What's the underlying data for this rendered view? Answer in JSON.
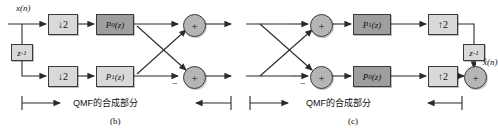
{
  "figure": {
    "name": "qmf-polyphase-analysis-synthesis",
    "panels": [
      {
        "id": "b",
        "panel_label": "(b)",
        "caption": "QMF的合成部分",
        "input_label": "x(n)",
        "output_label": "",
        "blocks": {
          "delay": {
            "label": "z",
            "exponent": "-1"
          },
          "sampler_top": {
            "label": "↓2"
          },
          "sampler_bottom": {
            "label": "↓2"
          },
          "filter_top": {
            "name": "P",
            "subscript": "0",
            "arg": "(z)",
            "shade": "dark"
          },
          "filter_bottom": {
            "name": "P",
            "subscript": "1",
            "arg": "(z)",
            "shade": "light"
          }
        },
        "adders": {
          "top": {
            "symbol": "+",
            "minus_port": "none"
          },
          "bottom": {
            "symbol": "+",
            "minus_port": "left"
          }
        },
        "minus_sign": "−"
      },
      {
        "id": "c",
        "panel_label": "(c)",
        "caption": "QMF的合成部分",
        "input_label": "",
        "output_label": "x̂(n)",
        "blocks": {
          "delay": {
            "label": "z",
            "exponent": "-1"
          },
          "sampler_top": {
            "label": "↑2"
          },
          "sampler_bottom": {
            "label": "↑2"
          },
          "filter_top": {
            "name": "P",
            "subscript": "1",
            "arg": "(z)",
            "shade": "dark"
          },
          "filter_bottom": {
            "name": "P",
            "subscript": "0",
            "arg": "(z)",
            "shade": "dark"
          }
        },
        "adders": {
          "top": {
            "symbol": "+",
            "minus_port": "none"
          },
          "bottom": {
            "symbol": "+",
            "minus_port": "left"
          },
          "output": {
            "symbol": "+",
            "minus_port": "none"
          }
        },
        "minus_sign": "−"
      }
    ],
    "colors": {
      "line": "#2b2b2b",
      "block_light": "#d9d9d9",
      "block_dark": "#9e9e9e",
      "adder_fill": "#b5b5b5",
      "text": "#111111",
      "background": "#ffffff"
    }
  }
}
